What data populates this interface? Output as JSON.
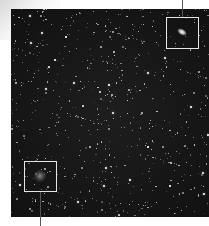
{
  "image": {
    "subject": "Star field astrophotograph with two highlighted regions",
    "background_color": "#141414"
  },
  "annotations": [
    {
      "name": "galaxy-highlight-box",
      "x": 166,
      "y": 17,
      "w": 33,
      "h": 32,
      "leader": {
        "x": 182,
        "from_y": 0,
        "to_y": 17
      }
    },
    {
      "name": "faint-object-highlight-box",
      "x": 24,
      "y": 161,
      "w": 33,
      "h": 31,
      "leader": {
        "x": 40,
        "from_y": 192,
        "to_y": 226
      }
    }
  ],
  "bright_stars": [
    [
      30,
      16,
      2.5
    ],
    [
      42,
      33,
      2.5
    ],
    [
      31,
      43,
      2.5
    ],
    [
      148,
      73,
      2.5
    ],
    [
      113,
      113,
      2.8
    ],
    [
      203,
      173,
      2.5
    ],
    [
      204,
      194,
      2
    ],
    [
      78,
      202,
      2.2
    ],
    [
      106,
      168,
      2
    ],
    [
      165,
      58,
      2
    ],
    [
      208,
      135,
      2
    ],
    [
      46,
      89,
      2
    ],
    [
      74,
      83,
      1.8
    ],
    [
      109,
      85,
      1.8
    ],
    [
      130,
      180,
      1.8
    ],
    [
      104,
      186,
      1.8
    ],
    [
      20,
      185,
      1.8
    ],
    [
      191,
      107,
      1.8
    ],
    [
      148,
      147,
      1.6
    ],
    [
      170,
      186,
      1.6
    ],
    [
      66,
      37,
      1.6
    ],
    [
      55,
      60,
      1.6
    ]
  ]
}
